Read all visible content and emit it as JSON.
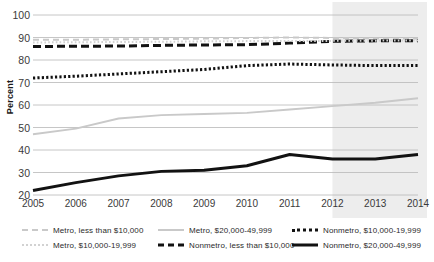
{
  "chart_data": {
    "type": "line",
    "title": "",
    "xlabel": "",
    "ylabel": "Percent",
    "ylim": [
      20,
      100
    ],
    "yticks": [
      20,
      30,
      40,
      50,
      60,
      70,
      80,
      90,
      100
    ],
    "grid": true,
    "legend_position": "bottom",
    "x": [
      2005,
      2006,
      2007,
      2008,
      2009,
      2010,
      2011,
      2012,
      2013,
      2014
    ],
    "xticklabels": [
      "2005",
      "2006",
      "2007",
      "2008",
      "2009",
      "2010",
      "2011",
      "2012",
      "2013",
      "2014"
    ],
    "shaded_region": {
      "label": "",
      "x_start": 2012,
      "x_end": 2014,
      "color": "#ededed"
    },
    "series": [
      {
        "name": "Metro, less than $10,000",
        "style": "dashed",
        "color": "#c9c9c9",
        "width": 2,
        "values": [
          89.0,
          89.0,
          89.2,
          89.3,
          89.5,
          89.8,
          90.0,
          89.8,
          89.6,
          89.5
        ]
      },
      {
        "name": "Nonmetro, less than $10,000",
        "style": "dashed",
        "color": "#121212",
        "width": 3,
        "values": [
          86.0,
          86.1,
          86.2,
          86.5,
          86.7,
          86.8,
          87.5,
          88.3,
          88.5,
          88.6
        ]
      },
      {
        "name": "Metro, $10,000-19,999",
        "style": "dotted",
        "color": "#d2d2d2",
        "width": 2,
        "values": [
          87.8,
          87.9,
          88.0,
          88.1,
          88.3,
          88.4,
          88.5,
          88.5,
          88.6,
          88.7
        ]
      },
      {
        "name": "Nonmetro, $10,000-19,999",
        "style": "dotted",
        "color": "#121212",
        "width": 3,
        "values": [
          72.0,
          72.8,
          73.8,
          74.8,
          75.8,
          77.5,
          78.2,
          77.8,
          77.5,
          77.6
        ]
      },
      {
        "name": "Metro, $20,000-49,999",
        "style": "solid",
        "color": "#c9c9c9",
        "width": 2,
        "values": [
          47.0,
          49.5,
          54.0,
          55.5,
          56.0,
          56.5,
          58.0,
          59.5,
          61.0,
          63.0
        ]
      },
      {
        "name": "Nonmetro, $20,000-49,999",
        "style": "solid",
        "color": "#121212",
        "width": 3,
        "values": [
          22.0,
          25.5,
          28.5,
          30.5,
          31.0,
          33.0,
          38.0,
          36.0,
          36.0,
          38.0
        ]
      }
    ]
  },
  "axis": {
    "y_title": "Percent"
  },
  "legend": {
    "items": [
      {
        "label": "Metro, less than $10,000",
        "swatch": "sw-metro-low",
        "icon": "dashed-line-light-icon"
      },
      {
        "label": "Metro, $10,000-19,999",
        "swatch": "sw-metro-mid",
        "icon": "dotted-line-light-icon"
      },
      {
        "label": "Metro, $20,000-49,999",
        "swatch": "sw-metro-high",
        "icon": "solid-line-light-icon"
      },
      {
        "label": "Nonmetro, less than $10,000",
        "swatch": "sw-nonmetro-low",
        "icon": "dashed-line-dark-icon"
      },
      {
        "label": "Nonmetro, $10,000-19,999",
        "swatch": "sw-nonmetro-mid",
        "icon": "dotted-line-dark-icon"
      },
      {
        "label": "Nonmetro, $20,000-49,999",
        "swatch": "sw-nonmetro-high",
        "icon": "solid-line-dark-icon"
      }
    ]
  }
}
